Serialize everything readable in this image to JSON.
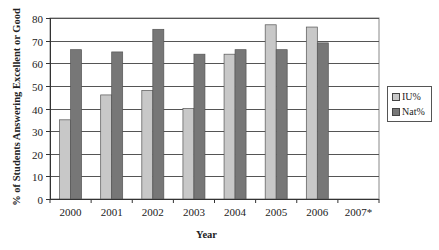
{
  "chart_data": {
    "type": "bar",
    "title": "",
    "xlabel": "Year",
    "ylabel": "% of Students Answering Excellent or Good",
    "categories": [
      "2000",
      "2001",
      "2002",
      "2003",
      "2004",
      "2005",
      "2006",
      "2007*"
    ],
    "series": [
      {
        "name": "IU%",
        "color": "#c8c8c8",
        "values": [
          35,
          46,
          48,
          40,
          64,
          77,
          76,
          null
        ]
      },
      {
        "name": "Nat%",
        "color": "#777777",
        "values": [
          66,
          65,
          75,
          64,
          66,
          66,
          69,
          null
        ]
      }
    ],
    "ylim": [
      0,
      80
    ],
    "yticks": [
      0,
      10,
      20,
      30,
      40,
      50,
      60,
      70,
      80
    ],
    "grid": true,
    "legend_position": "right"
  },
  "legend": {
    "items": [
      {
        "label": "IU%"
      },
      {
        "label": "Nat%"
      }
    ]
  }
}
